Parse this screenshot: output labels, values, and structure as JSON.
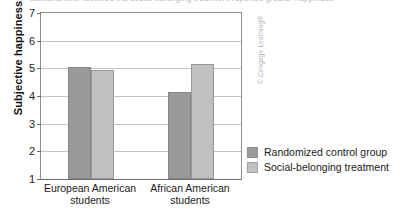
{
  "watermark": "© Cengage Learning®",
  "caption_sliver": "students who received the social-belonging treatment reported greater happiness",
  "colors": {
    "control_bar": "#9a9a9a",
    "treatment_bar": "#c0c0c0",
    "axis": "#6e6e6e",
    "gridline": "#c4c4c4",
    "text": "#1a1a1a",
    "watermark": "#b3b3b3"
  },
  "chart_data": {
    "type": "bar",
    "title": "",
    "xlabel": "",
    "ylabel": "Subjective happiness",
    "ylim": [
      1,
      7
    ],
    "yticks": [
      1,
      2,
      3,
      4,
      5,
      6,
      7
    ],
    "ytick_labels": [
      "1",
      "2",
      "3",
      "4",
      "5",
      "6",
      "7"
    ],
    "grid": true,
    "grid_axis": "y",
    "legend_position": "bottom-right",
    "categories": [
      "European American\nstudents",
      "African American\nstudents"
    ],
    "category_labels_flat": [
      "European American students",
      "African American students"
    ],
    "series": [
      {
        "name": "Randomized control group",
        "color": "#9a9a9a",
        "values": [
          5.05,
          4.15
        ]
      },
      {
        "name": "Social-belonging treatment",
        "color": "#c0c0c0",
        "values": [
          4.95,
          5.15
        ]
      }
    ]
  }
}
